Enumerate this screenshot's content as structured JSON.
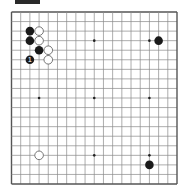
{
  "diagram": {
    "header_label": "",
    "board_size": 19,
    "colors": {
      "background": "#ffffff",
      "grid_line": "#8a8a8a",
      "border_line": "#555555",
      "black_stone": "#1a1a1a",
      "white_stone_fill": "#ffffff",
      "white_stone_stroke": "#555555",
      "label_on_black": "#ffffff"
    },
    "star_points": [
      [
        3,
        3
      ],
      [
        9,
        3
      ],
      [
        15,
        3
      ],
      [
        3,
        9
      ],
      [
        9,
        9
      ],
      [
        15,
        9
      ],
      [
        3,
        15
      ],
      [
        9,
        15
      ],
      [
        15,
        15
      ]
    ],
    "stones": [
      {
        "color": "black",
        "col": 2,
        "row": 2,
        "label": ""
      },
      {
        "color": "white",
        "col": 3,
        "row": 2,
        "label": ""
      },
      {
        "color": "black",
        "col": 2,
        "row": 3,
        "label": ""
      },
      {
        "color": "white",
        "col": 3,
        "row": 3,
        "label": ""
      },
      {
        "color": "black",
        "col": 3,
        "row": 4,
        "label": ""
      },
      {
        "color": "white",
        "col": 4,
        "row": 4,
        "label": ""
      },
      {
        "color": "black",
        "col": 2,
        "row": 5,
        "label": "1"
      },
      {
        "color": "white",
        "col": 4,
        "row": 5,
        "label": ""
      },
      {
        "color": "black",
        "col": 16,
        "row": 3,
        "label": ""
      },
      {
        "color": "white",
        "col": 3,
        "row": 15,
        "label": ""
      },
      {
        "color": "black",
        "col": 15,
        "row": 16,
        "label": ""
      }
    ]
  }
}
